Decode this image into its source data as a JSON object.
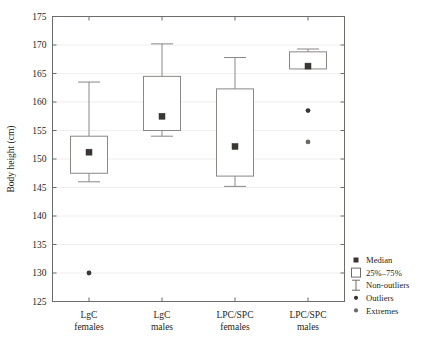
{
  "chart_data": {
    "type": "box",
    "title": "",
    "xlabel": "",
    "ylabel": "Body height (cm)",
    "ylim": [
      125,
      175
    ],
    "ytick_step": 5,
    "yticks": [
      "125",
      "130",
      "135",
      "140",
      "145",
      "150",
      "155",
      "160",
      "165",
      "170",
      "175"
    ],
    "grid": true,
    "legend_position": "right-bottom-outside",
    "categories": [
      "LgC\nfemales",
      "LgC\nmales",
      "LPC/SPC\nfemales",
      "LPC/SPC\nmales"
    ],
    "category_lines": [
      [
        "LgC",
        "females"
      ],
      [
        "LgC",
        "males"
      ],
      [
        "LPC/SPC",
        "females"
      ],
      [
        "LPC/SPC",
        "males"
      ]
    ],
    "boxes": [
      {
        "name": "LgC females",
        "whisker_low": 146.0,
        "q1": 147.5,
        "median": 151.2,
        "q3": 154.0,
        "whisker_high": 163.5,
        "outliers": [
          130.0
        ],
        "extremes": []
      },
      {
        "name": "LgC males",
        "whisker_low": 154.0,
        "q1": 155.0,
        "median": 157.5,
        "q3": 164.5,
        "whisker_high": 170.2,
        "outliers": [],
        "extremes": []
      },
      {
        "name": "LPC/SPC females",
        "whisker_low": 145.2,
        "q1": 147.0,
        "median": 152.2,
        "q3": 162.3,
        "whisker_high": 167.8,
        "outliers": [],
        "extremes": []
      },
      {
        "name": "LPC/SPC males",
        "whisker_low": 167.0,
        "q1": 165.8,
        "median": 166.3,
        "q3": 168.8,
        "whisker_high": 169.3,
        "outliers": [
          158.5
        ],
        "extremes": [
          153.0
        ]
      }
    ],
    "legend": [
      {
        "marker": "median-square",
        "label": "Median"
      },
      {
        "marker": "box-outline",
        "label": "25%–75%"
      },
      {
        "marker": "whisker-i",
        "label": "Non-outliers"
      },
      {
        "marker": "dot",
        "label": "Outliers"
      },
      {
        "marker": "star",
        "label": "Extremes"
      }
    ]
  },
  "colors": {
    "axis": "#6e6a68",
    "box_stroke": "#8b8785",
    "median": "#3a3634",
    "grid": "#f0eeee",
    "background": "#ffffff",
    "text": "#231f20"
  }
}
